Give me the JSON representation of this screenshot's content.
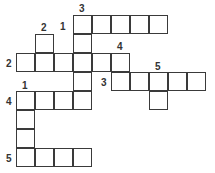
{
  "puzzle": {
    "type": "crossword",
    "cell_size": 19,
    "cells": [
      {
        "x": 73,
        "y": 15
      },
      {
        "x": 92,
        "y": 15
      },
      {
        "x": 111,
        "y": 15
      },
      {
        "x": 130,
        "y": 15
      },
      {
        "x": 149,
        "y": 15
      },
      {
        "x": 35,
        "y": 34
      },
      {
        "x": 73,
        "y": 34
      },
      {
        "x": 16,
        "y": 53
      },
      {
        "x": 35,
        "y": 53
      },
      {
        "x": 54,
        "y": 53
      },
      {
        "x": 73,
        "y": 53
      },
      {
        "x": 92,
        "y": 53
      },
      {
        "x": 111,
        "y": 53
      },
      {
        "x": 73,
        "y": 72
      },
      {
        "x": 111,
        "y": 72
      },
      {
        "x": 130,
        "y": 72
      },
      {
        "x": 149,
        "y": 72
      },
      {
        "x": 168,
        "y": 72
      },
      {
        "x": 187,
        "y": 72
      },
      {
        "x": 16,
        "y": 91
      },
      {
        "x": 35,
        "y": 91
      },
      {
        "x": 54,
        "y": 91
      },
      {
        "x": 73,
        "y": 91
      },
      {
        "x": 149,
        "y": 91
      },
      {
        "x": 16,
        "y": 110
      },
      {
        "x": 16,
        "y": 129
      },
      {
        "x": 16,
        "y": 148
      },
      {
        "x": 35,
        "y": 148
      },
      {
        "x": 54,
        "y": 148
      },
      {
        "x": 73,
        "y": 148
      }
    ],
    "labels": [
      {
        "text": "3",
        "x": 79,
        "y": 4
      },
      {
        "text": "1",
        "x": 60,
        "y": 22
      },
      {
        "text": "2",
        "x": 41,
        "y": 23
      },
      {
        "text": "2",
        "x": 6,
        "y": 59
      },
      {
        "text": "4",
        "x": 117,
        "y": 42
      },
      {
        "text": "3",
        "x": 101,
        "y": 78
      },
      {
        "text": "5",
        "x": 155,
        "y": 62
      },
      {
        "text": "1",
        "x": 22,
        "y": 81
      },
      {
        "text": "4",
        "x": 6,
        "y": 97
      },
      {
        "text": "5",
        "x": 6,
        "y": 154
      }
    ]
  }
}
